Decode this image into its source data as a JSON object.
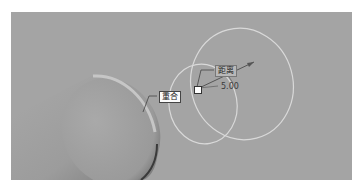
{
  "viewport": {
    "background": "#a4a4a4"
  },
  "constraints": {
    "coincident_label": "重合",
    "distance_label": "距离",
    "distance_value": "5.00"
  },
  "colors": {
    "circle_stroke": "#d9d9d9",
    "cylinder_face": "#9a9a9a",
    "dimension_line": "#555555"
  }
}
